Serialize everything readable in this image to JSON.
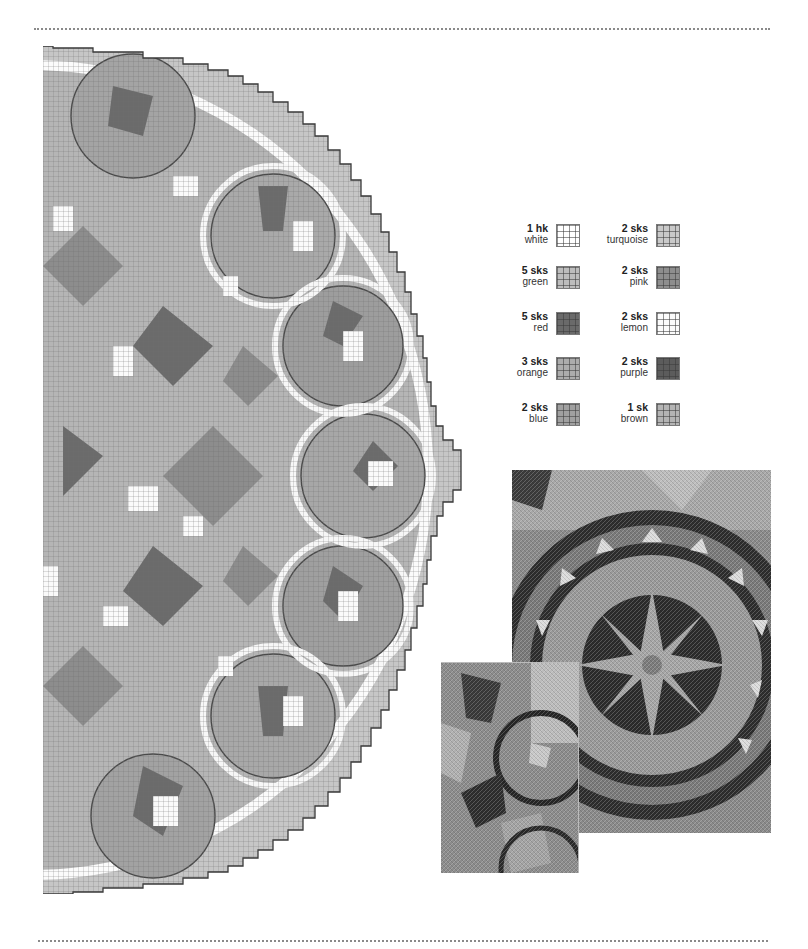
{
  "page": {
    "type": "needlepoint chart page",
    "rules": [
      "top dotted rule",
      "bottom dotted rule"
    ]
  },
  "chart": {
    "shape": "semicircle",
    "grid_cell_px": 5,
    "motifs": [
      "scalloped ring border",
      "petal rosettes",
      "central star"
    ]
  },
  "legend": {
    "items": [
      {
        "qty": "1 hk",
        "name": "white",
        "color": "#ffffff"
      },
      {
        "qty": "2 sks",
        "name": "turquoise",
        "color": "#c9c9c9"
      },
      {
        "qty": "5 sks",
        "name": "green",
        "color": "#bdbdbd"
      },
      {
        "qty": "2 sks",
        "name": "pink",
        "color": "#8e8e8e"
      },
      {
        "qty": "5 sks",
        "name": "red",
        "color": "#6a6a6a"
      },
      {
        "qty": "2 sks",
        "name": "lemon",
        "color": "#fbfbfb"
      },
      {
        "qty": "3 sks",
        "name": "orange",
        "color": "#acacac"
      },
      {
        "qty": "2 sks",
        "name": "purple",
        "color": "#5c5c5c"
      },
      {
        "qty": "2 sks",
        "name": "blue",
        "color": "#a0a0a0"
      },
      {
        "qty": "1 sk",
        "name": "brown",
        "color": "#b4b4b4"
      }
    ]
  },
  "photos": {
    "large": {
      "description": "Stitched detail: star medallion within a beaded ring"
    },
    "small": {
      "description": "Stitched detail: rosette petals and ring edge"
    }
  }
}
